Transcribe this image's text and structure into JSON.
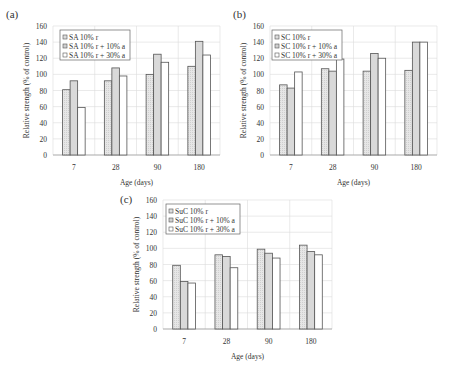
{
  "colors": {
    "series1_fill": "#e6e6e6",
    "series2_fill": "#d9d9d9",
    "series3_fill": "#ffffff",
    "bar_stroke": "#555555",
    "grid": "#dcdcdc",
    "axis": "#9a9a9a"
  },
  "chart_data": [
    {
      "type": "bar",
      "panel_label": "(a)",
      "title": "",
      "xlabel": "Age (days)",
      "ylabel": "Relative strength (% of control)",
      "ylim": [
        0,
        160
      ],
      "yticks": [
        0,
        20,
        40,
        60,
        80,
        100,
        120,
        140,
        160
      ],
      "grid": true,
      "legend_position": "upper left",
      "categories": [
        "7",
        "28",
        "90",
        "180"
      ],
      "series": [
        {
          "name": "SA 10% r",
          "values": [
            81,
            92,
            100,
            110
          ]
        },
        {
          "name": "SA 10% r + 10% a",
          "values": [
            92,
            108,
            125,
            141
          ]
        },
        {
          "name": "SA 10% r + 30% a",
          "values": [
            59,
            98,
            115,
            124
          ]
        }
      ]
    },
    {
      "type": "bar",
      "panel_label": "(b)",
      "title": "",
      "xlabel": "Age (days)",
      "ylabel": "Relative strength (% of control)",
      "ylim": [
        0,
        160
      ],
      "yticks": [
        0,
        20,
        40,
        60,
        80,
        100,
        120,
        140,
        160
      ],
      "grid": true,
      "legend_position": "upper left",
      "categories": [
        "7",
        "28",
        "90",
        "180"
      ],
      "series": [
        {
          "name": "SC 10% r",
          "values": [
            87,
            107,
            104,
            105
          ]
        },
        {
          "name": "SC 10% r + 10% a",
          "values": [
            83,
            104,
            126,
            140
          ]
        },
        {
          "name": "SC 10% r + 30% a",
          "values": [
            103,
            119,
            120,
            140
          ]
        }
      ]
    },
    {
      "type": "bar",
      "panel_label": "(c)",
      "title": "",
      "xlabel": "Age (days)",
      "ylabel": "Relative strength (% of control)",
      "ylim": [
        0,
        160
      ],
      "yticks": [
        0,
        20,
        40,
        60,
        80,
        100,
        120,
        140,
        160
      ],
      "grid": true,
      "legend_position": "upper left",
      "categories": [
        "7",
        "28",
        "90",
        "180"
      ],
      "series": [
        {
          "name": "SuC 10% r",
          "values": [
            79,
            92,
            99,
            104
          ]
        },
        {
          "name": "SuC 10% r + 10% a",
          "values": [
            59,
            90,
            94,
            96
          ]
        },
        {
          "name": "SuC 10% r + 30% a",
          "values": [
            57,
            76,
            88,
            92
          ]
        }
      ]
    }
  ],
  "layout": [
    {
      "label_x": 6,
      "label_y": 18,
      "plot_left": 53,
      "plot_right": 220,
      "plot_top": 26,
      "plot_bottom": 155,
      "legend_x": 60,
      "legend_y": 30,
      "legend_w": 70
    },
    {
      "label_x": 233,
      "label_y": 18,
      "plot_left": 270,
      "plot_right": 437,
      "plot_top": 26,
      "plot_bottom": 155,
      "legend_x": 272,
      "legend_y": 30,
      "legend_w": 70
    },
    {
      "label_x": 120,
      "label_y": 203,
      "plot_left": 163,
      "plot_right": 332,
      "plot_top": 200,
      "plot_bottom": 329,
      "legend_x": 166,
      "legend_y": 204,
      "legend_w": 74
    }
  ]
}
